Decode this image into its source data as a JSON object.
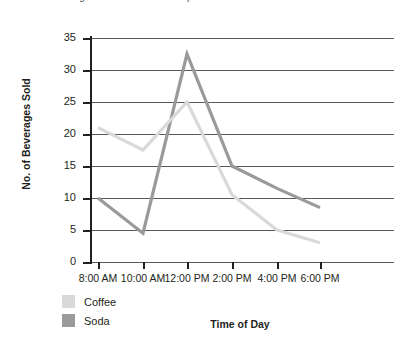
{
  "cut_title": "beverages sold at a coffee shop",
  "chart_data": {
    "type": "line",
    "title": "",
    "xlabel": "Time of Day",
    "ylabel": "No. of Beverages Sold",
    "categories": [
      "8:00 AM",
      "10:00 AM",
      "12:00 PM",
      "2:00 PM",
      "4:00 PM",
      "6:00 PM"
    ],
    "series": [
      {
        "name": "Coffee",
        "color": "#d9d9d9",
        "values": [
          21,
          17.5,
          25,
          10.5,
          5,
          3
        ]
      },
      {
        "name": "Soda",
        "color": "#9a9a9a",
        "values": [
          10,
          4.5,
          32.5,
          15,
          11.5,
          8.5
        ]
      }
    ],
    "ylim": [
      0,
      35
    ],
    "ytick_values": [
      0,
      5,
      10,
      15,
      20,
      25,
      30,
      35
    ],
    "ytick_labels": [
      "0",
      "5",
      "10",
      "15",
      "20",
      "25",
      "30",
      "35"
    ],
    "grid": true,
    "legend_position": "bottom-left"
  }
}
